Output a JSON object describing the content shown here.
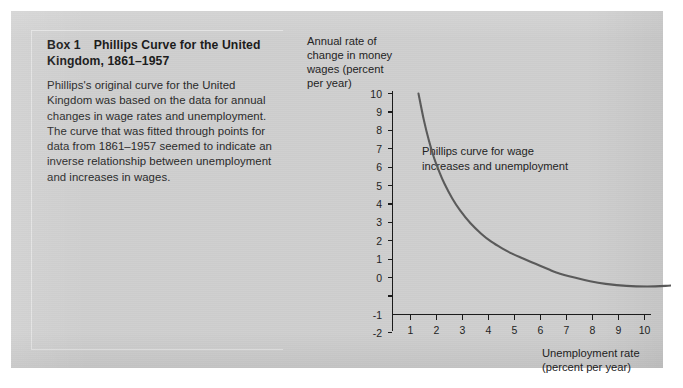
{
  "panel": {
    "background_color": "#cfcfcf"
  },
  "box": {
    "label": "Box 1",
    "title": "Phillips Curve for the United Kingdom, 1861–1957",
    "body": "Phillips's original curve for the United Kingdom was based on the data for annual changes in wage rates and unemployment. The curve that was fitted through points for data from 1861–1957 seemed to indicate an inverse relationship between unemployment and increases in wages."
  },
  "chart_data": {
    "type": "line",
    "title": "",
    "ylabel": "Annual rate of change in money wages (percent per year)",
    "xlabel": "Unemployment rate (percent per year)",
    "annotation": "Phillips curve for wage increases and unemployment",
    "series_name": "Phillips curve",
    "series_color": "#5a5a5a",
    "axis_color": "#1a1a1a",
    "grid": false,
    "legend": "none",
    "xlim": [
      0,
      11.5
    ],
    "ylim": [
      -2,
      10
    ],
    "xticks": [
      1,
      2,
      3,
      4,
      5,
      6,
      7,
      8,
      9,
      10
    ],
    "yticks": [
      -2,
      -1,
      0,
      1,
      2,
      3,
      4,
      5,
      6,
      7,
      8,
      9,
      10
    ],
    "xtick_labels": [
      "1",
      "2",
      "3",
      "4",
      "5",
      "6",
      "7",
      "8",
      "9",
      "10"
    ],
    "ytick_labels": [
      "10",
      "9",
      "8",
      "7",
      "6",
      "5",
      "4",
      "3",
      "2",
      "1",
      "0",
      "-1",
      "-2"
    ],
    "x": [
      1.0,
      1.2,
      1.4,
      1.6,
      1.8,
      2.0,
      2.3,
      2.6,
      3.0,
      3.4,
      3.8,
      4.2,
      4.6,
      5.0,
      5.5,
      6.0,
      6.3,
      7.0,
      7.6,
      8.2,
      9.0,
      9.8,
      10.5,
      11.0
    ],
    "y": [
      10.0,
      8.6,
      7.45,
      6.5,
      5.75,
      5.1,
      4.3,
      3.65,
      2.95,
      2.4,
      1.95,
      1.6,
      1.3,
      1.05,
      0.75,
      0.45,
      0.28,
      0.0,
      -0.2,
      -0.34,
      -0.45,
      -0.48,
      -0.45,
      -0.4
    ]
  }
}
